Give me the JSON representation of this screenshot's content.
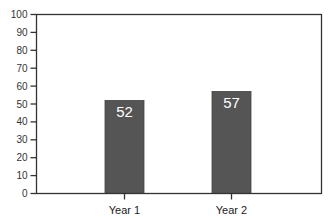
{
  "chart_data": {
    "type": "bar",
    "title": "",
    "xlabel": "",
    "ylabel": "",
    "categories": [
      "Year 1",
      "Year 2"
    ],
    "values": [
      52,
      57
    ],
    "data_labels": [
      "52",
      "57"
    ],
    "ylim": [
      0,
      100
    ],
    "yticks": [
      0,
      10,
      20,
      30,
      40,
      50,
      60,
      70,
      80,
      90,
      100
    ],
    "ytick_labels": [
      "0",
      "10",
      "20",
      "30",
      "40",
      "50",
      "60",
      "70",
      "80",
      "90",
      "100"
    ],
    "grid": false,
    "legend": null,
    "colors": {
      "bar": "#555555",
      "frame": "#333333",
      "bar_label": "#ffffff"
    }
  }
}
